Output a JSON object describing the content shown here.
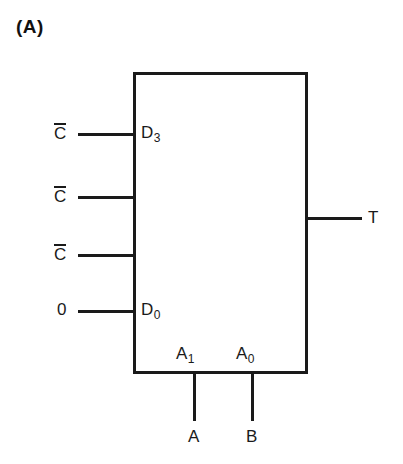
{
  "figure": {
    "label": "(A)",
    "device": "4-to-1 multiplexer"
  },
  "colors": {
    "line": "#1a1a1a",
    "background": "#ffffff"
  },
  "inputs": [
    {
      "signal": "C",
      "overbar": true,
      "port": "D",
      "port_sub": "3",
      "y": 134
    },
    {
      "signal": "C",
      "overbar": true,
      "port": "",
      "port_sub": "",
      "y": 197
    },
    {
      "signal": "C",
      "overbar": true,
      "port": "",
      "port_sub": "",
      "y": 255
    },
    {
      "signal": "0",
      "overbar": false,
      "port": "D",
      "port_sub": "0",
      "y": 311
    }
  ],
  "select_inputs": [
    {
      "port": "A",
      "port_sub": "1",
      "signal": "A",
      "x": 194
    },
    {
      "port": "A",
      "port_sub": "0",
      "signal": "B",
      "x": 252
    }
  ],
  "output": {
    "label": "T",
    "y": 218
  }
}
